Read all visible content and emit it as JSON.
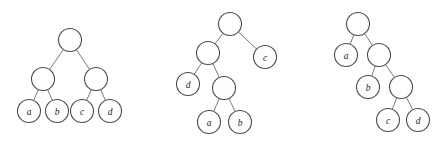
{
  "figure": {
    "background_color": "#ffffff",
    "node_fill_color": "#ffffff",
    "node_stroke_color": "#4a4a52",
    "edge_color": "#6b6b73",
    "label_color": "#23232a",
    "node_radius": 11.5
  },
  "trees": [
    {
      "id": "tree-1",
      "name": "balanced-tree",
      "nodes": [
        {
          "id": "t1-root",
          "label": "",
          "x": 70,
          "y": 40
        },
        {
          "id": "t1-left",
          "label": "",
          "x": 43,
          "y": 79
        },
        {
          "id": "t1-right",
          "label": "",
          "x": 96,
          "y": 79
        },
        {
          "id": "t1-a",
          "label": "a",
          "x": 29,
          "y": 111
        },
        {
          "id": "t1-b",
          "label": "b",
          "x": 57,
          "y": 111
        },
        {
          "id": "t1-c",
          "label": "c",
          "x": 82,
          "y": 111
        },
        {
          "id": "t1-d",
          "label": "d",
          "x": 110,
          "y": 111
        }
      ],
      "edges": [
        {
          "from": "t1-root",
          "to": "t1-left"
        },
        {
          "from": "t1-root",
          "to": "t1-right"
        },
        {
          "from": "t1-left",
          "to": "t1-a"
        },
        {
          "from": "t1-left",
          "to": "t1-b"
        },
        {
          "from": "t1-right",
          "to": "t1-c"
        },
        {
          "from": "t1-right",
          "to": "t1-d"
        }
      ]
    },
    {
      "id": "tree-2",
      "name": "left-deep-tree",
      "nodes": [
        {
          "id": "t2-root",
          "label": "",
          "x": 230,
          "y": 24
        },
        {
          "id": "t2-in1",
          "label": "",
          "x": 208,
          "y": 53
        },
        {
          "id": "t2-c",
          "label": "c",
          "x": 265,
          "y": 57
        },
        {
          "id": "t2-d",
          "label": "d",
          "x": 188,
          "y": 84
        },
        {
          "id": "t2-in2",
          "label": "",
          "x": 224,
          "y": 88
        },
        {
          "id": "t2-a",
          "label": "a",
          "x": 209,
          "y": 122
        },
        {
          "id": "t2-b",
          "label": "b",
          "x": 240,
          "y": 122
        }
      ],
      "edges": [
        {
          "from": "t2-root",
          "to": "t2-in1"
        },
        {
          "from": "t2-root",
          "to": "t2-c"
        },
        {
          "from": "t2-in1",
          "to": "t2-d"
        },
        {
          "from": "t2-in1",
          "to": "t2-in2"
        },
        {
          "from": "t2-in2",
          "to": "t2-a"
        },
        {
          "from": "t2-in2",
          "to": "t2-b"
        }
      ]
    },
    {
      "id": "tree-3",
      "name": "right-deep-tree",
      "nodes": [
        {
          "id": "t3-root",
          "label": "",
          "x": 358,
          "y": 24
        },
        {
          "id": "t3-a",
          "label": "a",
          "x": 346,
          "y": 55
        },
        {
          "id": "t3-in1",
          "label": "",
          "x": 379,
          "y": 55
        },
        {
          "id": "t3-b",
          "label": "b",
          "x": 368,
          "y": 87
        },
        {
          "id": "t3-in2",
          "label": "",
          "x": 401,
          "y": 87
        },
        {
          "id": "t3-c",
          "label": "c",
          "x": 388,
          "y": 120
        },
        {
          "id": "t3-d",
          "label": "d",
          "x": 418,
          "y": 120
        }
      ],
      "edges": [
        {
          "from": "t3-root",
          "to": "t3-a"
        },
        {
          "from": "t3-root",
          "to": "t3-in1"
        },
        {
          "from": "t3-in1",
          "to": "t3-b"
        },
        {
          "from": "t3-in1",
          "to": "t3-in2"
        },
        {
          "from": "t3-in2",
          "to": "t3-c"
        },
        {
          "from": "t3-in2",
          "to": "t3-d"
        }
      ]
    }
  ]
}
